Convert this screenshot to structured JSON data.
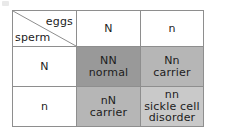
{
  "figure": {
    "type": "punnett-square",
    "corner": {
      "eggs_label": "eggs",
      "sperm_label": "sperm"
    },
    "column_headers": [
      "N",
      "n"
    ],
    "row_headers": [
      "N",
      "n"
    ],
    "cells": [
      {
        "genotype": "NN",
        "phenotype": "normal",
        "shade": "#999999",
        "row": "N",
        "column": "N"
      },
      {
        "genotype": "Nn",
        "phenotype": "carrier",
        "shade": "#b6b6b6",
        "row": "N",
        "column": "n"
      },
      {
        "genotype": "nN",
        "phenotype": "carrier",
        "shade": "#b6b6b6",
        "row": "n",
        "column": "N"
      },
      {
        "genotype": "nn",
        "phenotype_line1": "sickle cell",
        "phenotype_line2": "disorder",
        "shade": "#c9c9c9",
        "row": "n",
        "column": "n"
      }
    ],
    "border_color": "#8e8e8e",
    "background_color": "#ffffff"
  }
}
